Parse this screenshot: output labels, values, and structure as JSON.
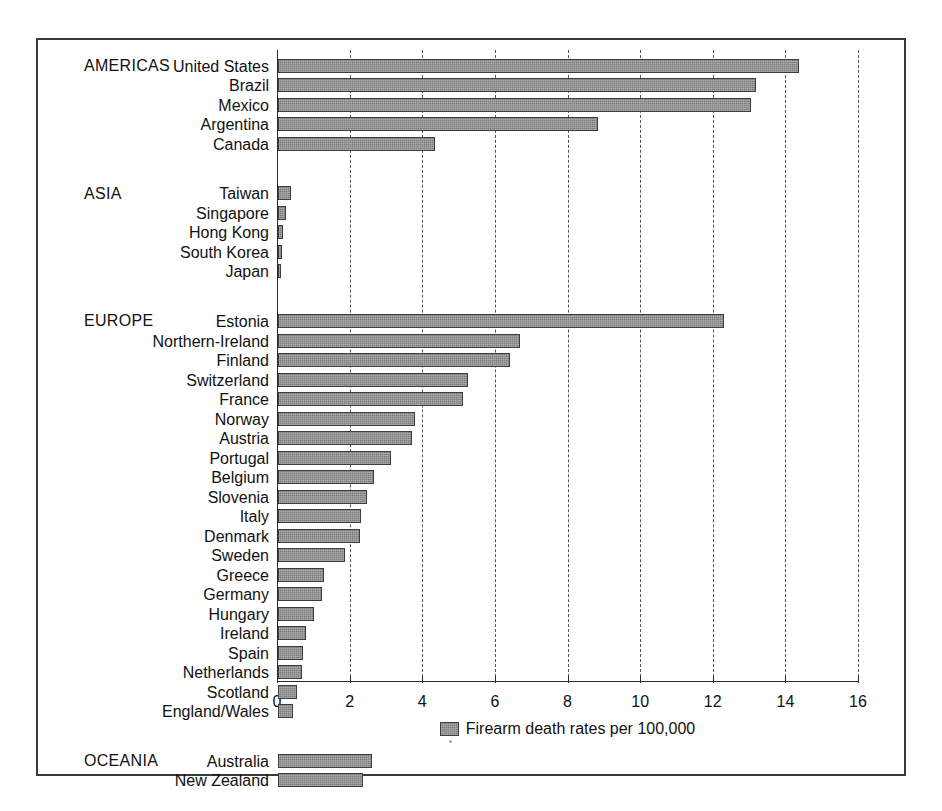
{
  "chart_data": {
    "type": "bar",
    "orientation": "horizontal",
    "title": "",
    "subtitle": "",
    "xlabel": "",
    "ylabel": "",
    "xlim": [
      0,
      16
    ],
    "xticks": [
      0,
      2,
      4,
      6,
      8,
      10,
      12,
      14,
      16
    ],
    "xtick_labels": [
      "0",
      "2",
      "4",
      "6",
      "8",
      "10",
      "12",
      "14",
      "16"
    ],
    "grid": "vertical-dashed",
    "legend_position": "bottom-center",
    "legend_entries": [
      "Firearm death rates per 100,000"
    ],
    "series_name": "Firearm death rates per 100,000",
    "bar_color": "#7c7c7c",
    "bar_edge_color": "#3d3d3d",
    "groups": [
      {
        "region": "AMERICAS",
        "categories": [
          "United States",
          "Brazil",
          "Mexico",
          "Argentina",
          "Canada"
        ],
        "values": [
          14.35,
          13.17,
          13.03,
          8.8,
          4.32
        ]
      },
      {
        "region": "ASIA",
        "categories": [
          "Taiwan",
          "Singapore",
          "Hong Kong",
          "South Korea",
          "Japan"
        ],
        "values": [
          0.36,
          0.22,
          0.14,
          0.12,
          0.07
        ]
      },
      {
        "region": "EUROPE",
        "categories": [
          "Estonia",
          "Northern-Ireland",
          "Finland",
          "Switzerland",
          "France",
          "Norway",
          "Austria",
          "Portugal",
          "Belgium",
          "Slovenia",
          "Italy",
          "Denmark",
          "Sweden",
          "Greece",
          "Germany",
          "Hungary",
          "Ireland",
          "Spain",
          "Netherlands",
          "Scotland",
          "England/Wales"
        ],
        "values": [
          12.29,
          6.67,
          6.4,
          5.24,
          5.1,
          3.77,
          3.7,
          3.11,
          2.65,
          2.45,
          2.29,
          2.26,
          1.85,
          1.26,
          1.21,
          1.0,
          0.77,
          0.68,
          0.65,
          0.52,
          0.4
        ]
      },
      {
        "region": "OCEANIA",
        "categories": [
          "Australia",
          "New Zealand"
        ],
        "values": [
          2.6,
          2.35
        ]
      }
    ]
  }
}
